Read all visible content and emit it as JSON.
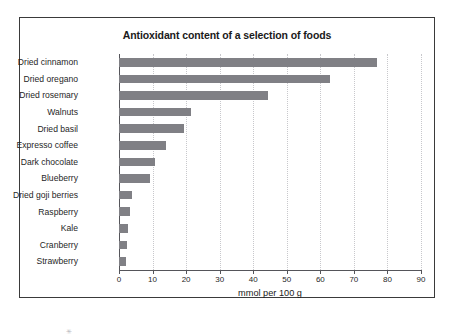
{
  "figure": {
    "title": "Antioxidant content of a selection of foods",
    "stray_mark": "✳",
    "colors": {
      "bar_fill": "#808085",
      "frame": "#3a3a3a",
      "axis": "#55555a",
      "grid": "#c8c8cc",
      "background": "#ffffff",
      "text": "#1f1f1f"
    }
  },
  "chart_data": {
    "type": "bar",
    "orientation": "horizontal",
    "title": "Antioxidant content of a selection of foods",
    "xlabel": "mmol per 100 g",
    "ylabel": "",
    "xlim": [
      0,
      90
    ],
    "xticks": [
      0,
      10,
      20,
      30,
      40,
      50,
      60,
      70,
      80,
      90
    ],
    "xtick_labels": [
      "0",
      "10",
      "20",
      "30",
      "40",
      "50",
      "60",
      "70",
      "80",
      "90"
    ],
    "grid": true,
    "grid_axis": "x",
    "legend": false,
    "categories": [
      "Dried cinnamon",
      "Dried oregano",
      "Dried rosemary",
      "Walnuts",
      "Dried basil",
      "Expresso coffee",
      "Dark chocolate",
      "Blueberry",
      "Dried goji berries",
      "Raspberry",
      "Kale",
      "Cranberry",
      "Strawberry"
    ],
    "values": [
      77,
      63,
      44.5,
      21.5,
      19.5,
      14,
      10.8,
      9.2,
      4,
      3.2,
      2.7,
      2.4,
      2
    ]
  }
}
